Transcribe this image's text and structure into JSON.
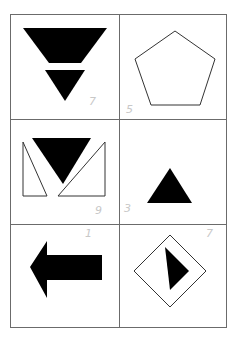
{
  "figure": {
    "cells": [
      {
        "shape": "two inverted black triangles stacked",
        "note": "7"
      },
      {
        "shape": "outlined pentagon",
        "note": "5"
      },
      {
        "shape": "inverted black triangle between two outlined right triangles",
        "note": "9"
      },
      {
        "shape": "small black triangle",
        "note": "3"
      },
      {
        "shape": "black left arrow",
        "note": "1"
      },
      {
        "shape": "outlined diamond with black triangle inside",
        "note": "7"
      }
    ],
    "colors": {
      "ink": "#000000",
      "border": "#6b6b6b",
      "note": "#c8c8c8"
    }
  }
}
